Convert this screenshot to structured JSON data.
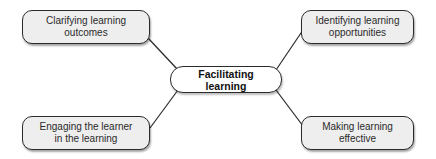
{
  "diagram": {
    "type": "mind-map",
    "center": {
      "label": "Facilitating learning"
    },
    "branches": [
      {
        "position": "top-left",
        "label": "Clarifying learning outcomes",
        "lines": [
          "Clarifying learning",
          "outcomes"
        ]
      },
      {
        "position": "top-right",
        "label": "Identifying learning opportunities",
        "lines": [
          "Identifying learning",
          "opportunities"
        ]
      },
      {
        "position": "bottom-left",
        "label": "Engaging the learner in the learning",
        "lines": [
          "Engaging the learner",
          "in the learning"
        ]
      },
      {
        "position": "bottom-right",
        "label": "Making learning effective",
        "lines": [
          "Making learning",
          "effective"
        ]
      }
    ],
    "colors": {
      "node_fill": "#eeeeee",
      "center_fill": "#ffffff",
      "stroke": "#2b2b2b",
      "text": "#2a2a2a"
    }
  }
}
